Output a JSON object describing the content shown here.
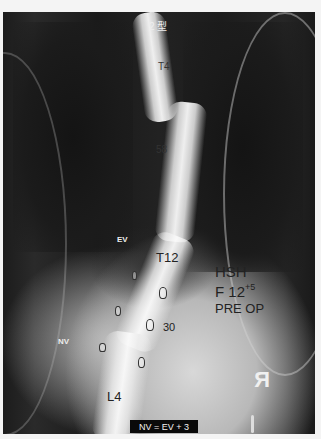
{
  "image": {
    "type": "spine-xray",
    "view": "posteroanterior",
    "annotations": {
      "type_label": "2 型",
      "upper_level": "T4",
      "upper_curve_angle": "58",
      "ev_label": "EV",
      "t12_label": "T12",
      "lower_curve_angle": "30",
      "nv_label": "NV",
      "lower_level": "L4",
      "patient_initials": "HSH",
      "patient_sex_age": "F 12",
      "age_months": "+5",
      "status": "PRE OP",
      "side_marker": "R",
      "formula": "NV =  EV + 3"
    }
  }
}
